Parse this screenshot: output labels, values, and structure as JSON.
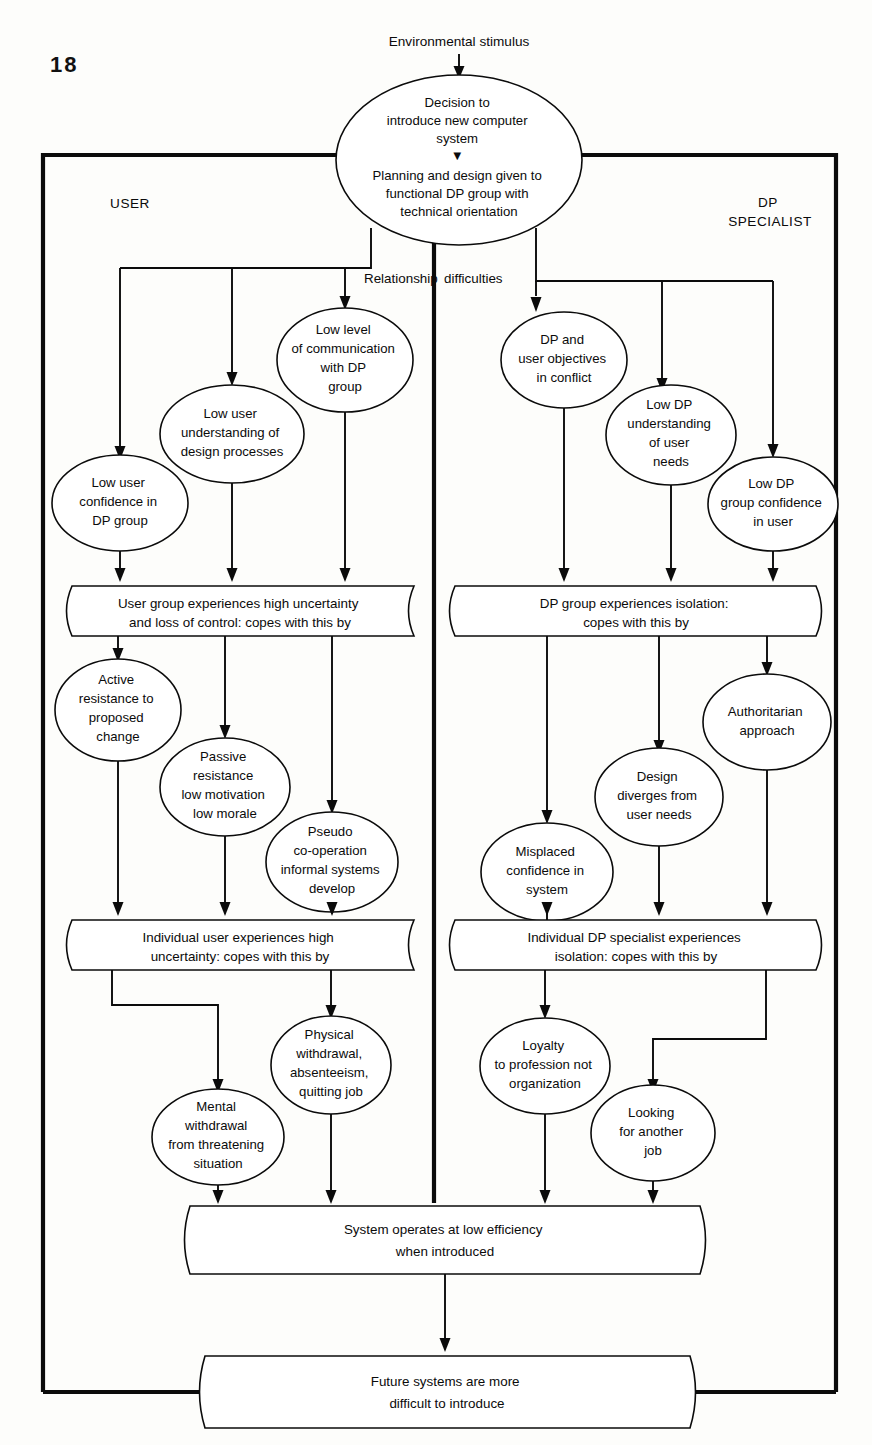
{
  "page": {
    "number": "18",
    "background_color": "#fdfdfb",
    "ink_color": "#0b0b0b"
  },
  "diagram": {
    "title_caption": "Environmental stimulus",
    "column_labels": {
      "left": "USER",
      "right": "DP\nSPECIALIST",
      "left_line1": "USER",
      "right_line1": "DP",
      "right_line2": "SPECIALIST"
    },
    "edge_labels": {
      "relationship": "Relationship",
      "difficulties": "difficulties"
    },
    "top_node": {
      "lines": [
        "Decision to",
        "introduce new computer",
        "system",
        "▼",
        "Planning and design given to",
        "functional DP group with",
        "technical orientation"
      ]
    },
    "user_level1": [
      {
        "lines": [
          "Low user",
          "confidence in",
          "DP group"
        ]
      },
      {
        "lines": [
          "Low user",
          "understanding of",
          "design processes"
        ]
      },
      {
        "lines": [
          "Low level",
          "of communication",
          "with DP",
          "group"
        ]
      }
    ],
    "dp_level1": [
      {
        "lines": [
          "DP and",
          "user objectives",
          "in conflict"
        ]
      },
      {
        "lines": [
          "Low DP",
          "understanding",
          "of user",
          "needs"
        ]
      },
      {
        "lines": [
          "Low DP",
          "group confidence",
          "in user"
        ]
      }
    ],
    "bar_user_group": {
      "lines": [
        "User group experiences high uncertainty",
        "and loss of control: copes with this by"
      ]
    },
    "bar_dp_group": {
      "lines": [
        "DP group experiences isolation:",
        "copes with this by"
      ]
    },
    "user_level2": [
      {
        "lines": [
          "Active",
          "resistance to",
          "proposed",
          "change"
        ]
      },
      {
        "lines": [
          "Passive",
          "resistance",
          "low motivation",
          "low morale"
        ]
      },
      {
        "lines": [
          "Pseudo",
          "co-operation",
          "informal systems",
          "develop"
        ]
      }
    ],
    "dp_level2": [
      {
        "lines": [
          "Misplaced",
          "confidence in",
          "system"
        ]
      },
      {
        "lines": [
          "Design",
          "diverges from",
          "user needs"
        ]
      },
      {
        "lines": [
          "Authoritarian",
          "approach"
        ]
      }
    ],
    "bar_user_individual": {
      "lines": [
        "Individual user experiences high",
        "uncertainty: copes with this by"
      ]
    },
    "bar_dp_individual": {
      "lines": [
        "Individual DP specialist experiences",
        "isolation: copes with this by"
      ]
    },
    "user_level3": [
      {
        "lines": [
          "Mental",
          "withdrawal",
          "from threatening",
          "situation"
        ]
      },
      {
        "lines": [
          "Physical",
          "withdrawal,",
          "absenteeism,",
          "quitting job"
        ]
      }
    ],
    "dp_level3": [
      {
        "lines": [
          "Loyalty",
          "to profession not",
          "organization"
        ]
      },
      {
        "lines": [
          "Looking",
          "for another",
          "job"
        ]
      }
    ],
    "bar_system": {
      "lines": [
        "System operates at low efficiency",
        "when introduced"
      ]
    },
    "bar_future": {
      "lines": [
        "Future systems are more",
        "difficult to introduce"
      ]
    }
  }
}
